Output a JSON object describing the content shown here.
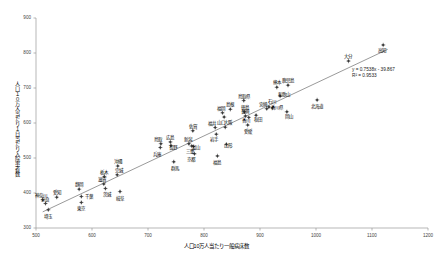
{
  "chart_data": {
    "type": "scatter",
    "title": "",
    "xlabel": "人口10万人当たり一般病床数",
    "ylabel": "人口１０万人当たり１日当たり入院患者数",
    "xlim": [
      500,
      1200
    ],
    "ylim": [
      300,
      900
    ],
    "xticks": [
      500,
      600,
      700,
      800,
      900,
      1000,
      1100,
      1200
    ],
    "yticks": [
      300,
      400,
      500,
      600,
      700,
      800,
      900
    ],
    "grid": false,
    "legend": "none",
    "trendline": {
      "equation": "y = 0.7538x - 39.867",
      "r2_text": "R² = 0.9533",
      "slope": 0.7538,
      "intercept": -39.867,
      "r_squared": 0.9533,
      "x_start": 512,
      "x_end": 1128
    },
    "points": [
      {
        "label": "神奈川",
        "x": 512,
        "y": 381,
        "lx": -2,
        "ly": -7
      },
      {
        "label": "奈良",
        "x": 517,
        "y": 370,
        "lx": -1,
        "ly": -7
      },
      {
        "label": "埼玉",
        "x": 522,
        "y": 352,
        "lx": 0,
        "ly": 4
      },
      {
        "label": "愛知",
        "x": 537,
        "y": 388,
        "lx": 0,
        "ly": -7
      },
      {
        "label": "静岡",
        "x": 577,
        "y": 411,
        "lx": 0,
        "ly": -7
      },
      {
        "label": "千葉",
        "x": 581,
        "y": 390,
        "lx": 8,
        "ly": -3
      },
      {
        "label": "東京",
        "x": 581,
        "y": 373,
        "lx": 0,
        "ly": 4
      },
      {
        "label": "滋賀",
        "x": 621,
        "y": 426,
        "lx": -2,
        "ly": -7
      },
      {
        "label": "栃木",
        "x": 622,
        "y": 447,
        "lx": 0,
        "ly": -7
      },
      {
        "label": "茨城",
        "x": 624,
        "y": 413,
        "lx": 2,
        "ly": 4
      },
      {
        "label": "完城",
        "x": 645,
        "y": 452,
        "lx": 2,
        "ly": -7
      },
      {
        "label": "沖縄",
        "x": 646,
        "y": 477,
        "lx": 0,
        "ly": -7
      },
      {
        "label": "岐阜",
        "x": 650,
        "y": 404,
        "lx": 0,
        "ly": 4
      },
      {
        "label": "兵庫",
        "x": 722,
        "y": 530,
        "lx": -3,
        "ly": 4
      },
      {
        "label": "鳥取",
        "x": 723,
        "y": 541,
        "lx": -3,
        "ly": -7
      },
      {
        "label": "広島",
        "x": 740,
        "y": 546,
        "lx": 0,
        "ly": -7
      },
      {
        "label": "長野",
        "x": 741,
        "y": 536,
        "lx": 2,
        "ly": 0
      },
      {
        "label": "群馬",
        "x": 746,
        "y": 489,
        "lx": 1,
        "ly": 4
      },
      {
        "label": "新潟",
        "x": 773,
        "y": 541,
        "lx": -1,
        "ly": -7
      },
      {
        "label": "三重",
        "x": 778,
        "y": 534,
        "lx": -2,
        "ly": 3
      },
      {
        "label": "富山",
        "x": 781,
        "y": 533,
        "lx": 3,
        "ly": -1
      },
      {
        "label": "佐賀",
        "x": 780,
        "y": 578,
        "lx": 0,
        "ly": -7
      },
      {
        "label": "京都",
        "x": 783,
        "y": 512,
        "lx": -3,
        "ly": 3
      },
      {
        "label": "福井",
        "x": 820,
        "y": 587,
        "lx": -3,
        "ly": -7
      },
      {
        "label": "岩手",
        "x": 822,
        "y": 568,
        "lx": -2,
        "ly": 3
      },
      {
        "label": "福島",
        "x": 824,
        "y": 506,
        "lx": 0,
        "ly": 4
      },
      {
        "label": "福岡",
        "x": 833,
        "y": 629,
        "lx": -1,
        "ly": -7
      },
      {
        "label": "山口",
        "x": 836,
        "y": 617,
        "lx": -3,
        "ly": 3
      },
      {
        "label": "大阪",
        "x": 838,
        "y": 588,
        "lx": 3,
        "ly": -7
      },
      {
        "label": "山形",
        "x": 840,
        "y": 539,
        "lx": 2,
        "ly": -1
      },
      {
        "label": "島根",
        "x": 847,
        "y": 639,
        "lx": 0,
        "ly": -7
      },
      {
        "label": "鳥取県",
        "x": 871,
        "y": 664,
        "lx": 0,
        "ly": -7
      },
      {
        "label": "徳島",
        "x": 872,
        "y": 632,
        "lx": 1,
        "ly": -7
      },
      {
        "label": "長崎",
        "x": 874,
        "y": 620,
        "lx": 0,
        "ly": -7
      },
      {
        "label": "愛媛",
        "x": 878,
        "y": 594,
        "lx": 0,
        "ly": 4
      },
      {
        "label": "香川",
        "x": 880,
        "y": 616,
        "lx": -3,
        "ly": 1
      },
      {
        "label": "秋田",
        "x": 893,
        "y": 622,
        "lx": 2,
        "ly": 2
      },
      {
        "label": "宮崎",
        "x": 912,
        "y": 641,
        "lx": -4,
        "ly": -7
      },
      {
        "label": "石川",
        "x": 916,
        "y": 646,
        "lx": 3,
        "ly": -8
      },
      {
        "label": "香川県",
        "x": 922,
        "y": 643,
        "lx": 5,
        "ly": -3
      },
      {
        "label": "熊本",
        "x": 930,
        "y": 702,
        "lx": 0,
        "ly": -7
      },
      {
        "label": "和歌山",
        "x": 936,
        "y": 677,
        "lx": 4,
        "ly": -4
      },
      {
        "label": "岡山",
        "x": 948,
        "y": 632,
        "lx": 2,
        "ly": 2
      },
      {
        "label": "鹿児島",
        "x": 950,
        "y": 708,
        "lx": 0,
        "ly": -7
      },
      {
        "label": "北海道",
        "x": 1002,
        "y": 666,
        "lx": 0,
        "ly": 4
      },
      {
        "label": "大分",
        "x": 1058,
        "y": 777,
        "lx": 0,
        "ly": -7
      },
      {
        "label": "高知",
        "x": 1120,
        "y": 823,
        "lx": -1,
        "ly": 3
      }
    ]
  },
  "axes": {
    "y_tick_labels": [
      "900",
      "800",
      "700",
      "600",
      "500",
      "400",
      "300"
    ],
    "x_tick_labels": [
      "500",
      "600",
      "700",
      "800",
      "900",
      "1000",
      "1100",
      "1200"
    ]
  },
  "colors": {
    "axis": "#9a9a9a",
    "marker": "#3a3a3a",
    "trendline": "#555555",
    "text": "#000000"
  }
}
